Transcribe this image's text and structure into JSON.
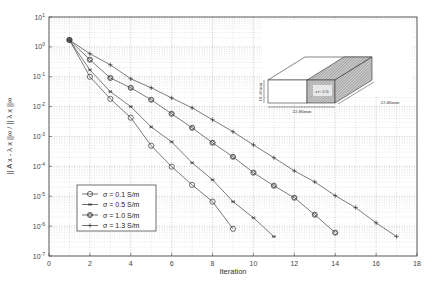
{
  "chart_data": {
    "type": "line",
    "title": "",
    "xlabel": "Iteration",
    "ylabel": "|| A x - λ x ||∞ / || λ x ||∞",
    "yscale": "log",
    "xlim": [
      0,
      18
    ],
    "ylim": [
      1e-07,
      10
    ],
    "grid": true,
    "legend_position": "lower left",
    "x_ticks": [
      "0",
      "2",
      "4",
      "6",
      "8",
      "10",
      "12",
      "14",
      "16",
      "18"
    ],
    "y_ticks": [
      "10^1",
      "10^0",
      "10^-1",
      "10^-2",
      "10^-3",
      "10^-4",
      "10^-5",
      "10^-6",
      "10^-7"
    ],
    "series": [
      {
        "name": "σ = 0.1 S/m",
        "marker": "circle",
        "x": [
          1,
          2,
          3,
          4,
          5,
          6,
          7,
          8,
          9
        ],
        "log10_y": [
          0.23,
          -1.0,
          -1.74,
          -2.37,
          -3.31,
          -4.01,
          -4.62,
          -5.18,
          -6.09
        ]
      },
      {
        "name": "σ = 0.5 S/m",
        "marker": "star",
        "x": [
          1,
          2,
          3,
          4,
          5,
          6,
          7,
          8,
          9,
          10,
          11
        ],
        "log10_y": [
          0.23,
          -0.77,
          -1.5,
          -2.0,
          -2.68,
          -3.18,
          -3.88,
          -4.45,
          -5.18,
          -5.72,
          -6.35
        ]
      },
      {
        "name": "σ = 1.0 S/m",
        "marker": "circle-diamond",
        "x": [
          1,
          2,
          3,
          4,
          5,
          6,
          7,
          8,
          9,
          10,
          11,
          12,
          13,
          14
        ],
        "log10_y": [
          0.23,
          -0.43,
          -1.04,
          -1.37,
          -1.77,
          -2.24,
          -2.71,
          -3.21,
          -3.68,
          -4.21,
          -4.65,
          -5.05,
          -5.62,
          -6.22
        ]
      },
      {
        "name": "σ = 1.3 S/m",
        "marker": "plus",
        "x": [
          1,
          2,
          3,
          4,
          5,
          6,
          7,
          8,
          9,
          10,
          11,
          12,
          13,
          14,
          15,
          16,
          17
        ],
        "log10_y": [
          0.23,
          -0.23,
          -0.6,
          -1.07,
          -1.37,
          -1.71,
          -2.04,
          -2.44,
          -2.84,
          -3.28,
          -3.71,
          -4.15,
          -4.52,
          -4.98,
          -5.38,
          -5.89,
          -6.35
        ]
      }
    ],
    "annotations": {
      "inset": {
        "description": "Dielectric-loaded rectangular block (waveguide cavity) sketch",
        "material_label": "εr=2.0",
        "height_label": "10.16mm",
        "width_label": "22.86mm",
        "depth_label": "22.86mm"
      }
    }
  }
}
